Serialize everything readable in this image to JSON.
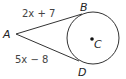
{
  "diagram": {
    "type": "geometry-tangent-segments",
    "points": {
      "A": {
        "label": "A"
      },
      "B": {
        "label": "B"
      },
      "C": {
        "label": "C"
      },
      "D": {
        "label": "D"
      }
    },
    "segments": {
      "AB": {
        "expression": "2x + 7"
      },
      "AD": {
        "expression": "5x − 8"
      }
    },
    "circle": {
      "center": "C"
    },
    "colors": {
      "stroke": "#333333",
      "text": "#444444",
      "background": "#ffffff"
    }
  }
}
